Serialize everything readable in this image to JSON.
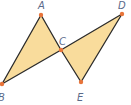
{
  "figure": {
    "type": "geometry-diagram",
    "colors": {
      "fill": "#f9dc9c",
      "stroke": "#2b2b2b",
      "point": "#e8743a",
      "label": "#5a6a8a"
    },
    "points": [
      {
        "name": "A",
        "x": 41,
        "y": 15,
        "label_x": 38,
        "label_y": 9
      },
      {
        "name": "B",
        "x": 2,
        "y": 84,
        "label_x": -2,
        "label_y": 101
      },
      {
        "name": "C",
        "x": 61,
        "y": 50,
        "label_x": 59,
        "label_y": 45
      },
      {
        "name": "D",
        "x": 122,
        "y": 14,
        "label_x": 118,
        "label_y": 9
      },
      {
        "name": "E",
        "x": 81,
        "y": 82,
        "label_x": 77,
        "label_y": 101
      }
    ],
    "triangles": [
      {
        "name": "triangle-ABC",
        "vertices": [
          "A",
          "B",
          "C"
        ]
      },
      {
        "name": "triangle-CDE",
        "vertices": [
          "C",
          "D",
          "E"
        ]
      }
    ]
  }
}
